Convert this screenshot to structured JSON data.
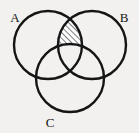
{
  "figure": {
    "kind": "venn-diagram",
    "title": "",
    "background_color": "#f2f1ef",
    "stroke_color": "#151515",
    "stroke_width": 2.4,
    "canvas": {
      "width": 139,
      "height": 133
    }
  },
  "sets": [
    {
      "id": "A",
      "label": "A",
      "label_x": 15,
      "label_y": 22,
      "center_x": 48,
      "center_y": 45,
      "radius": 34
    },
    {
      "id": "B",
      "label": "B",
      "label_x": 124,
      "label_y": 22,
      "center_x": 92,
      "center_y": 45,
      "radius": 34
    },
    {
      "id": "C",
      "label": "C",
      "label_x": 50,
      "label_y": 127,
      "center_x": 70,
      "center_y": 78,
      "radius": 34
    }
  ],
  "shading": {
    "region_expression": "(A ∩ B) \\ C",
    "description": "Region inside circle A and circle B but outside circle C",
    "pattern": "diagonal-hatch",
    "hatch_angle_deg": 45,
    "hatch_spacing_px": 4,
    "hatch_stroke_width": 1.1,
    "hatch_color": "#161616",
    "fill_color": "#ffffff"
  }
}
